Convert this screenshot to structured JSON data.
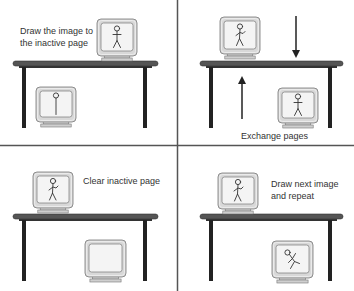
{
  "diagram": {
    "colors": {
      "background": "#ffffff",
      "divider": "#555555",
      "table_top": "#555555",
      "table_edge": "#333333",
      "table_leg": "#222222",
      "monitor_bezel": "#d8d8d8",
      "monitor_outline": "#777777",
      "screen": "#f4f4f4",
      "figure": "#333333",
      "arrow": "#222222",
      "text": "#333333"
    },
    "panels": [
      {
        "id": "draw-inactive",
        "caption_lines": [
          "Draw the image to",
          "the inactive page"
        ],
        "active_page_figure": "standing",
        "inactive_page_figure": "partial",
        "arrows": []
      },
      {
        "id": "exchange",
        "caption_lines": [
          "Exchange pages"
        ],
        "active_page_figure": "waving",
        "inactive_page_figure": "standing",
        "arrows": [
          "down",
          "up"
        ]
      },
      {
        "id": "clear-inactive",
        "caption_lines": [
          "Clear inactive page"
        ],
        "active_page_figure": "waving",
        "inactive_page_figure": "none",
        "arrows": []
      },
      {
        "id": "draw-next",
        "caption_lines": [
          "Draw next image",
          "and repeat"
        ],
        "active_page_figure": "waving",
        "inactive_page_figure": "tumbling",
        "arrows": []
      }
    ]
  }
}
